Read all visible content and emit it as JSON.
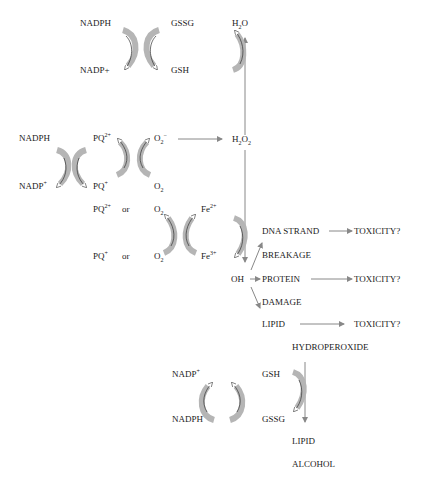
{
  "diagram": {
    "colors": {
      "arrow": "#888888",
      "band_fill": "#b5b5b5",
      "text": "#1a1a1a"
    },
    "top_cycle": {
      "nadph": "NADPH",
      "nadp_plus": "NADP+",
      "gssg": "GSSG",
      "gsh": "GSH",
      "h2o": {
        "base": "H",
        "sub": "2",
        "tail": "O"
      }
    },
    "pq_cycle": {
      "nadph": "NADPH",
      "nadp": {
        "base": "NADP",
        "sup": "+"
      },
      "pq2": {
        "base": "PQ",
        "sup": "2+"
      },
      "pq1": {
        "base": "PQ",
        "sup": "+"
      },
      "o2_radical": {
        "base": "O",
        "sub": "2",
        "sup": "−"
      },
      "o2": {
        "base": "O",
        "sub": "2"
      },
      "h2o2": {
        "b1": "H",
        "s1": "2",
        "b2": "O",
        "s2": "2"
      }
    },
    "fenton": {
      "pq2": {
        "base": "PQ",
        "sup": "2+"
      },
      "pq1": {
        "base": "PQ",
        "sup": "+"
      },
      "or1": "or",
      "or2": "or",
      "o2_top": {
        "base": "O",
        "sub": "2"
      },
      "o2_bottom": {
        "base": "O",
        "sub": "2"
      },
      "fe2": {
        "base": "Fe",
        "sup": "2+"
      },
      "fe3": {
        "base": "Fe",
        "sup": "3+"
      }
    },
    "damage": {
      "oh": "OH",
      "dna_strand": "DNA STRAND",
      "breakage": "BREAKAGE",
      "protein": "PROTEIN",
      "damage": "DAMAGE",
      "lipid": "LIPID",
      "hydroperoxide": "HYDROPEROXIDE",
      "toxicity1": "TOXICITY?",
      "toxicity2": "TOXICITY?",
      "toxicity3": "TOXICITY?"
    },
    "bottom_cycle": {
      "nadp": {
        "base": "NADP",
        "sup": "+"
      },
      "nadph": "NADPH",
      "gsh": "GSH",
      "gssg": "GSSG",
      "lipid": "LIPID",
      "alcohol": "ALCOHOL"
    }
  }
}
